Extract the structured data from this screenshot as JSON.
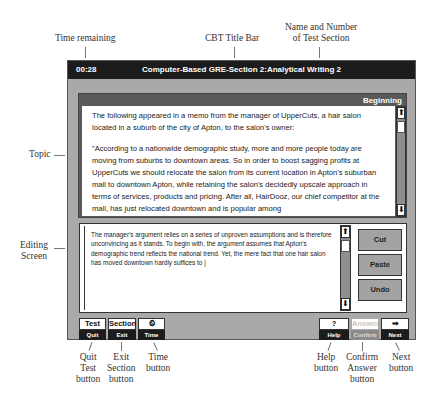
{
  "callouts": {
    "time_remaining": "Time remaining",
    "cbt_title_bar": "CBT Title Bar",
    "section_name_line1": "Name and Number",
    "section_name_line2": "of Test Section",
    "topic": "Topic",
    "editing_line1": "Editing",
    "editing_line2": "Screen",
    "quit_line1": "Quit",
    "quit_line2": "Test",
    "quit_line3": "button",
    "exit_line1": "Exit",
    "exit_line2": "Section",
    "exit_line3": "button",
    "time_line1": "Time",
    "time_line2": "button",
    "help_line1": "Help",
    "help_line2": "button",
    "confirm_line1": "Confirm",
    "confirm_line2": "Answer",
    "confirm_line3": "button",
    "next_line1": "Next",
    "next_line2": "button"
  },
  "titlebar": {
    "time": "00:28",
    "title": "Computer-Based GRE-Section 2:Analytical Writing 2"
  },
  "topic": {
    "header": "Beginning",
    "para1": "The following appeared in a memo from the manager of UpperCuts, a hair salon located in a suburb of the city of Apton, to the salon's owner:",
    "para2": "\"According to a nationwide demographic study, more and more people today are moving from suburbs to downtown areas. So in order to boost sagging profits at UpperCuts we should relocate the salon from its current location in Apton's suburban mall to downtown Apton, while retaining the salon's decidedly upscale approach in terms of services, products and pricing. After all, HairDooz, our chief competitor at the mall, has just relocated downtown and is popular among"
  },
  "editor": {
    "text": "The manager's argument relies on a series of unproven assumptions and is therefore unconvincing as it stands. To begin with, the argument assumes that Apton's demographic trend reflects the national trend. Yet, the mere fact that one hair salon has moved downtown hardly suffices to |",
    "buttons": {
      "cut": "Cut",
      "paste": "Paste",
      "undo": "Undo"
    }
  },
  "scroll": {
    "up": "⬆",
    "down": "⬇"
  },
  "toolbar": {
    "test": {
      "top": "Test",
      "bottom": "Quit"
    },
    "section": {
      "top": "Section",
      "bottom": "Exit"
    },
    "time": {
      "top": "⏲",
      "bottom": "Time"
    },
    "help": {
      "top": "?",
      "bottom": "Help"
    },
    "answer": {
      "top": "Answer",
      "bottom": "Confirm"
    },
    "next": {
      "top": "➡",
      "bottom": "Next"
    }
  }
}
